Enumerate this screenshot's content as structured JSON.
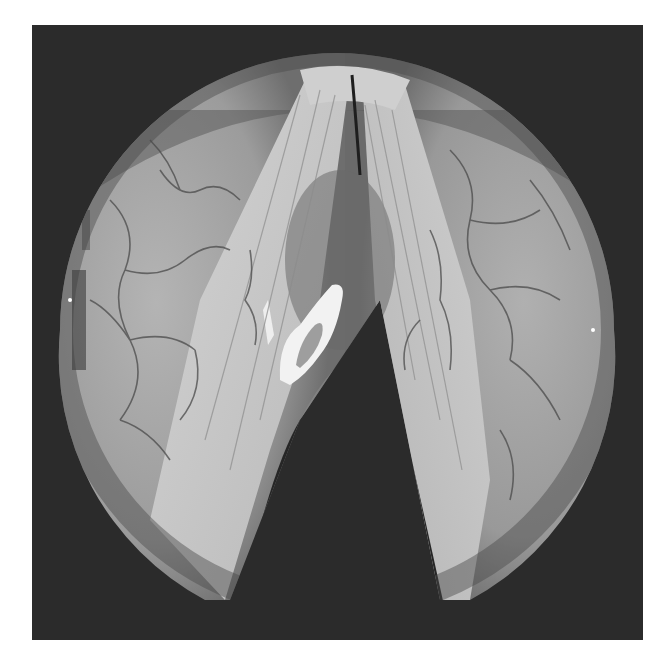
{
  "image": {
    "kind": "laryngoscopic photograph",
    "colormode": "grayscale",
    "frame_color": "#2b2b2b",
    "background_color": "#ffffff",
    "field_center": [
      337,
      330
    ],
    "field_radius": 277,
    "regions": [
      {
        "name": "left-ventricular-fold",
        "tone": "#9a9a9a"
      },
      {
        "name": "right-ventricular-fold",
        "tone": "#969696"
      },
      {
        "name": "left-vocal-cord",
        "tone": "#c8c8c8"
      },
      {
        "name": "right-vocal-cord",
        "tone": "#c4c4c4"
      },
      {
        "name": "glottic-opening",
        "tone": "#262626"
      },
      {
        "name": "anterior-commissure",
        "tone": "#bdbdbd"
      },
      {
        "name": "white-lesion",
        "tone": "#f2f2f2"
      }
    ]
  }
}
